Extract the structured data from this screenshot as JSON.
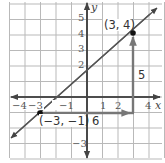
{
  "graph": {
    "x_range": [
      -5,
      5
    ],
    "y_range": [
      -4,
      6
    ],
    "axis_labels": {
      "x": "x",
      "y": "y"
    },
    "x_ticks": [
      {
        "value": -4,
        "label": "−4"
      },
      {
        "value": -3,
        "label": "−3"
      },
      {
        "value": -1,
        "label": "−1"
      },
      {
        "value": 1,
        "label": "1"
      },
      {
        "value": 2,
        "label": "2"
      },
      {
        "value": 4,
        "label": "4"
      }
    ],
    "y_ticks": [
      {
        "value": 5,
        "label": "5"
      },
      {
        "value": 4,
        "label": "4"
      },
      {
        "value": 3,
        "label": "3"
      },
      {
        "value": 2,
        "label": "2"
      },
      {
        "value": -3,
        "label": "−3"
      }
    ],
    "points": [
      {
        "x": 3,
        "y": 4,
        "label": "(3, 4)"
      },
      {
        "x": -3,
        "y": -1,
        "label": "(−3, −1)"
      }
    ],
    "line": {
      "through": [
        [
          -3,
          -1
        ],
        [
          3,
          4
        ]
      ],
      "slope": "5/6"
    },
    "run": {
      "from": [
        -3,
        -1
      ],
      "to": [
        3,
        -1
      ],
      "label": "6"
    },
    "rise": {
      "from": [
        3,
        -1
      ],
      "to": [
        3,
        4
      ],
      "label": "5"
    },
    "colors": {
      "grid": "#b9b9b9",
      "axis": "#444444",
      "line": "#555555",
      "arrows": "#707070",
      "point": "#111111"
    }
  }
}
